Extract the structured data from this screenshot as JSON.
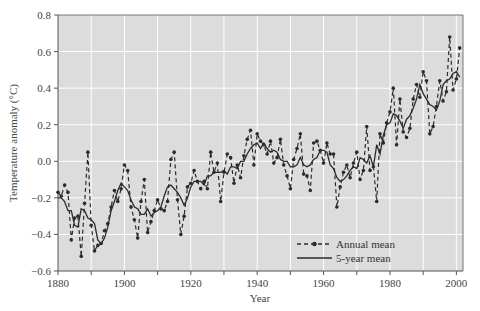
{
  "chart_data": {
    "type": "line",
    "title": "",
    "xlabel": "Year",
    "ylabel": "Temperature anomaly (°C)",
    "xlim": [
      1880,
      2002
    ],
    "ylim": [
      -0.6,
      0.8
    ],
    "x_ticks": [
      1880,
      1900,
      1920,
      1940,
      1960,
      1980,
      2000
    ],
    "x_tick_labels": [
      "1880",
      "1900",
      "1920",
      "1940",
      "1960",
      "1980",
      "2000"
    ],
    "y_ticks": [
      -0.6,
      -0.4,
      -0.2,
      0.0,
      0.2,
      0.4,
      0.6,
      0.8
    ],
    "y_tick_labels": [
      "−0.6",
      "−0.4",
      "−0.2",
      "0.0",
      "0.2",
      "0.4",
      "0.6",
      "0.8"
    ],
    "grid": true,
    "grid_x_step": 10,
    "grid_y_step": 0.2,
    "legend_position": "lower right",
    "legend": [
      {
        "label": "Annual mean",
        "style": "dashed-with-markers"
      },
      {
        "label": "5-year mean",
        "style": "solid"
      }
    ],
    "x_start": 1880,
    "series": [
      {
        "name": "Annual mean",
        "values": [
          -0.17,
          -0.19,
          -0.13,
          -0.17,
          -0.43,
          -0.31,
          -0.3,
          -0.52,
          -0.23,
          0.05,
          -0.35,
          -0.49,
          -0.46,
          -0.45,
          -0.38,
          -0.34,
          -0.25,
          -0.16,
          -0.22,
          -0.15,
          -0.02,
          -0.05,
          -0.25,
          -0.32,
          -0.42,
          -0.22,
          -0.1,
          -0.39,
          -0.33,
          -0.27,
          -0.21,
          -0.26,
          -0.27,
          -0.22,
          0.01,
          0.05,
          -0.21,
          -0.4,
          -0.3,
          -0.14,
          -0.12,
          -0.05,
          -0.11,
          -0.15,
          -0.11,
          -0.15,
          0.05,
          -0.06,
          -0.01,
          -0.22,
          -0.06,
          0.04,
          0.02,
          -0.12,
          -0.02,
          -0.09,
          0.03,
          0.12,
          0.17,
          -0.02,
          0.15,
          0.11,
          0.09,
          0.04,
          0.11,
          -0.01,
          0.02,
          0.12,
          -0.02,
          -0.08,
          -0.15,
          0.01,
          0.07,
          0.15,
          -0.07,
          -0.08,
          -0.16,
          0.1,
          0.11,
          0.06,
          -0.01,
          0.1,
          0.04,
          0.04,
          -0.25,
          -0.14,
          -0.06,
          -0.02,
          -0.09,
          -0.01,
          0.05,
          -0.1,
          -0.05,
          0.19,
          -0.05,
          -0.03,
          -0.22,
          0.15,
          0.1,
          0.21,
          0.27,
          0.4,
          0.09,
          0.34,
          0.16,
          0.13,
          0.18,
          0.34,
          0.42,
          0.35,
          0.49,
          0.44,
          0.15,
          0.19,
          0.3,
          0.44,
          0.33,
          0.38,
          0.68,
          0.39,
          0.45,
          0.62
        ]
      },
      {
        "name": "5-year mean",
        "values": [
          -0.2,
          -0.2,
          -0.22,
          -0.27,
          -0.27,
          -0.35,
          -0.36,
          -0.26,
          -0.27,
          -0.31,
          -0.32,
          -0.34,
          -0.43,
          -0.45,
          -0.42,
          -0.36,
          -0.27,
          -0.22,
          -0.16,
          -0.12,
          -0.14,
          -0.16,
          -0.21,
          -0.25,
          -0.26,
          -0.29,
          -0.29,
          -0.26,
          -0.3,
          -0.28,
          -0.27,
          -0.25,
          -0.19,
          -0.14,
          -0.13,
          -0.15,
          -0.17,
          -0.2,
          -0.24,
          -0.2,
          -0.14,
          -0.11,
          -0.11,
          -0.11,
          -0.13,
          -0.08,
          -0.08,
          -0.06,
          -0.06,
          -0.06,
          -0.05,
          -0.07,
          -0.03,
          -0.03,
          -0.04,
          0.0,
          0.0,
          0.04,
          0.07,
          0.09,
          0.1,
          0.07,
          0.1,
          0.07,
          0.05,
          0.06,
          0.05,
          0.01,
          0.0,
          0.0,
          -0.03,
          -0.03,
          -0.02,
          0.02,
          -0.02,
          -0.03,
          -0.02,
          0.01,
          0.02,
          0.06,
          0.06,
          0.05,
          -0.02,
          -0.04,
          -0.09,
          -0.11,
          -0.1,
          -0.08,
          -0.05,
          -0.03,
          -0.04,
          0.02,
          0.01,
          -0.01,
          0.03,
          -0.03,
          0.09,
          0.04,
          0.14,
          0.2,
          0.21,
          0.26,
          0.25,
          0.22,
          0.18,
          0.23,
          0.25,
          0.29,
          0.34,
          0.42,
          0.37,
          0.34,
          0.31,
          0.3,
          0.28,
          0.33,
          0.42,
          0.44,
          0.45,
          0.48,
          0.49,
          0.46
        ]
      }
    ]
  },
  "colors": {
    "plot_background": "#dcdcdc",
    "grid": "#ffffff",
    "series": "#2b2b2b",
    "axis": "#555555",
    "page_background": "#ffffff"
  }
}
